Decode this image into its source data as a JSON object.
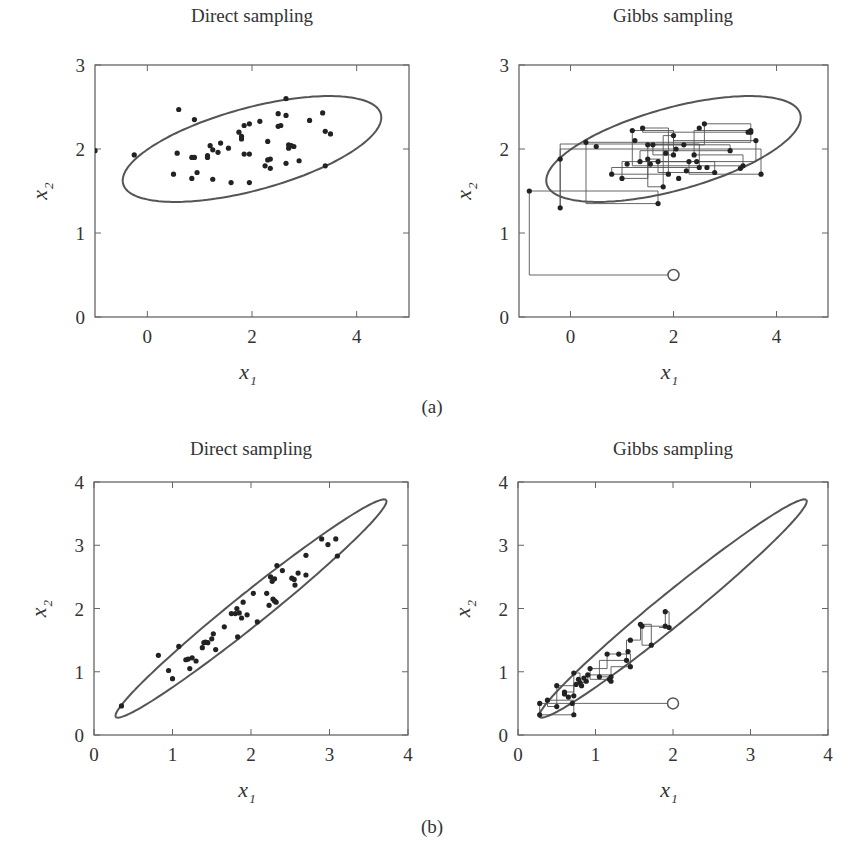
{
  "figure": {
    "caption_a": "(a)",
    "caption_b": "(b)",
    "colors": {
      "frame": "#666666",
      "ellipse": "#555555",
      "points": "#222222",
      "path": "#555555",
      "text": "#333333"
    }
  },
  "chart_data": [
    {
      "id": "a-direct",
      "type": "scatter",
      "title": "Direct sampling",
      "xlabel": "x1",
      "ylabel": "x2",
      "xlim": [
        -1,
        5
      ],
      "ylim": [
        0,
        3
      ],
      "xticks": [
        0,
        2,
        4
      ],
      "yticks": [
        0,
        1,
        2,
        3
      ],
      "grid": false,
      "ellipse": {
        "cx": 2.0,
        "cy": 2.0,
        "rx": 2.5,
        "ry": 0.5,
        "angle_deg": 9
      },
      "points": [
        [
          -1.0,
          1.98
        ],
        [
          -0.25,
          1.93
        ],
        [
          0.6,
          2.47
        ],
        [
          0.9,
          2.35
        ],
        [
          0.57,
          1.95
        ],
        [
          0.5,
          1.7
        ],
        [
          0.85,
          1.65
        ],
        [
          0.95,
          1.72
        ],
        [
          0.85,
          1.9
        ],
        [
          0.9,
          1.9
        ],
        [
          1.15,
          1.92
        ],
        [
          1.15,
          1.9
        ],
        [
          1.2,
          2.04
        ],
        [
          1.25,
          1.99
        ],
        [
          1.35,
          1.96
        ],
        [
          1.4,
          2.07
        ],
        [
          1.25,
          1.64
        ],
        [
          1.55,
          2.01
        ],
        [
          1.6,
          1.6
        ],
        [
          1.75,
          2.2
        ],
        [
          1.8,
          2.15
        ],
        [
          1.8,
          2.12
        ],
        [
          1.85,
          2.28
        ],
        [
          1.85,
          1.94
        ],
        [
          1.95,
          1.94
        ],
        [
          1.95,
          2.3
        ],
        [
          1.95,
          1.6
        ],
        [
          2.15,
          2.33
        ],
        [
          2.25,
          1.8
        ],
        [
          2.3,
          2.09
        ],
        [
          2.3,
          1.87
        ],
        [
          2.35,
          1.88
        ],
        [
          2.35,
          1.77
        ],
        [
          2.5,
          2.27
        ],
        [
          2.55,
          2.28
        ],
        [
          2.5,
          2.42
        ],
        [
          2.65,
          2.6
        ],
        [
          2.65,
          2.4
        ],
        [
          2.7,
          2.05
        ],
        [
          2.7,
          2.01
        ],
        [
          2.75,
          2.04
        ],
        [
          2.8,
          2.03
        ],
        [
          2.65,
          1.83
        ],
        [
          2.9,
          1.86
        ],
        [
          3.1,
          2.34
        ],
        [
          3.35,
          2.43
        ],
        [
          3.4,
          2.21
        ],
        [
          3.5,
          2.18
        ],
        [
          3.4,
          1.8
        ]
      ]
    },
    {
      "id": "a-gibbs",
      "type": "scatter",
      "title": "Gibbs sampling",
      "xlabel": "x1",
      "ylabel": "x2",
      "xlim": [
        -1,
        5
      ],
      "ylim": [
        0,
        3
      ],
      "xticks": [
        0,
        2,
        4
      ],
      "yticks": [
        0,
        1,
        2,
        3
      ],
      "grid": false,
      "ellipse": {
        "cx": 2.0,
        "cy": 2.0,
        "rx": 2.5,
        "ry": 0.5,
        "angle_deg": 9
      },
      "start": [
        2.0,
        0.5
      ],
      "path": [
        [
          2.0,
          0.5
        ],
        [
          -0.8,
          0.5
        ],
        [
          -0.8,
          1.5
        ],
        [
          1.7,
          1.5
        ],
        [
          1.7,
          1.35
        ],
        [
          0.3,
          1.35
        ],
        [
          0.3,
          2.08
        ],
        [
          3.5,
          2.08
        ],
        [
          3.5,
          2.2
        ],
        [
          1.4,
          2.2
        ],
        [
          1.4,
          2.25
        ],
        [
          1.9,
          2.25
        ],
        [
          1.9,
          1.7
        ],
        [
          0.8,
          1.7
        ],
        [
          0.8,
          1.78
        ],
        [
          2.5,
          1.78
        ],
        [
          2.5,
          2.06
        ],
        [
          -0.2,
          2.06
        ],
        [
          -0.2,
          1.88
        ],
        [
          -0.2,
          1.3
        ],
        [
          -0.2,
          2.0
        ],
        [
          3.7,
          2.0
        ],
        [
          3.7,
          1.7
        ],
        [
          2.3,
          1.7
        ],
        [
          2.3,
          1.85
        ],
        [
          1.0,
          1.85
        ],
        [
          1.0,
          1.65
        ],
        [
          1.5,
          1.65
        ],
        [
          1.5,
          2.05
        ],
        [
          2.6,
          2.05
        ],
        [
          2.6,
          2.3
        ],
        [
          3.5,
          2.3
        ],
        [
          3.5,
          2.22
        ],
        [
          2.4,
          2.22
        ],
        [
          2.4,
          1.93
        ],
        [
          3.35,
          1.93
        ],
        [
          3.35,
          1.8
        ],
        [
          1.2,
          1.8
        ],
        [
          1.2,
          2.22
        ],
        [
          2.0,
          2.22
        ],
        [
          2.0,
          1.93
        ],
        [
          1.6,
          1.93
        ],
        [
          1.6,
          2.05
        ],
        [
          3.1,
          2.05
        ],
        [
          3.1,
          1.98
        ],
        [
          1.35,
          1.98
        ],
        [
          1.35,
          1.85
        ],
        [
          2.8,
          1.85
        ],
        [
          2.8,
          1.72
        ],
        [
          1.7,
          1.72
        ],
        [
          1.7,
          1.85
        ],
        [
          3.6,
          1.85
        ],
        [
          3.6,
          2.1
        ],
        [
          2.0,
          2.1
        ],
        [
          2.0,
          2.16
        ],
        [
          1.8,
          2.16
        ],
        [
          1.8,
          1.55
        ],
        [
          1.5,
          1.55
        ],
        [
          1.5,
          1.88
        ],
        [
          1.75,
          1.88
        ]
      ],
      "points": [
        [
          -0.8,
          1.5
        ],
        [
          1.7,
          1.35
        ],
        [
          0.3,
          2.08
        ],
        [
          3.5,
          2.2
        ],
        [
          1.4,
          2.25
        ],
        [
          1.9,
          1.7
        ],
        [
          0.8,
          1.7
        ],
        [
          2.5,
          1.78
        ],
        [
          -0.2,
          1.88
        ],
        [
          -0.2,
          1.3
        ],
        [
          3.7,
          1.7
        ],
        [
          2.3,
          1.85
        ],
        [
          1.0,
          1.65
        ],
        [
          1.5,
          2.05
        ],
        [
          2.6,
          2.3
        ],
        [
          3.5,
          2.22
        ],
        [
          2.4,
          1.93
        ],
        [
          3.35,
          1.8
        ],
        [
          1.2,
          2.22
        ],
        [
          2.0,
          1.93
        ],
        [
          1.6,
          2.05
        ],
        [
          3.1,
          1.98
        ],
        [
          1.35,
          1.85
        ],
        [
          2.8,
          1.72
        ],
        [
          1.7,
          1.85
        ],
        [
          3.6,
          2.1
        ],
        [
          2.0,
          2.16
        ],
        [
          1.8,
          1.55
        ],
        [
          1.5,
          1.88
        ],
        [
          0.5,
          2.03
        ],
        [
          1.25,
          2.1
        ],
        [
          2.2,
          2.05
        ],
        [
          2.5,
          2.25
        ],
        [
          3.3,
          1.77
        ],
        [
          3.45,
          2.2
        ],
        [
          2.1,
          1.65
        ],
        [
          1.1,
          1.82
        ],
        [
          2.25,
          1.74
        ],
        [
          1.55,
          1.82
        ],
        [
          2.45,
          1.85
        ],
        [
          1.85,
          1.95
        ],
        [
          2.05,
          2.0
        ],
        [
          2.65,
          1.78
        ]
      ]
    },
    {
      "id": "b-direct",
      "type": "scatter",
      "title": "Direct sampling",
      "xlabel": "x1",
      "ylabel": "x2",
      "xlim": [
        0,
        4
      ],
      "ylim": [
        0,
        4
      ],
      "xticks": [
        0,
        1,
        2,
        3,
        4
      ],
      "yticks": [
        0,
        1,
        2,
        3,
        4
      ],
      "grid": false,
      "ellipse": {
        "cx": 2.0,
        "cy": 2.0,
        "rx": 2.43,
        "ry": 0.23,
        "angle_deg": 45
      },
      "points": [
        [
          0.35,
          0.46
        ],
        [
          0.82,
          1.26
        ],
        [
          0.95,
          1.02
        ],
        [
          1.0,
          0.89
        ],
        [
          1.08,
          1.4
        ],
        [
          1.17,
          1.19
        ],
        [
          1.2,
          1.2
        ],
        [
          1.22,
          1.05
        ],
        [
          1.25,
          1.22
        ],
        [
          1.3,
          1.17
        ],
        [
          1.38,
          1.38
        ],
        [
          1.4,
          1.46
        ],
        [
          1.42,
          1.47
        ],
        [
          1.45,
          1.46
        ],
        [
          1.5,
          1.52
        ],
        [
          1.52,
          1.6
        ],
        [
          1.55,
          1.35
        ],
        [
          1.66,
          1.71
        ],
        [
          1.75,
          1.92
        ],
        [
          1.8,
          1.92
        ],
        [
          1.82,
          2.0
        ],
        [
          1.83,
          1.55
        ],
        [
          1.85,
          1.93
        ],
        [
          1.88,
          1.85
        ],
        [
          1.9,
          2.1
        ],
        [
          1.95,
          1.9
        ],
        [
          2.03,
          2.24
        ],
        [
          2.08,
          1.79
        ],
        [
          2.2,
          2.24
        ],
        [
          2.23,
          2.05
        ],
        [
          2.25,
          2.5
        ],
        [
          2.27,
          2.43
        ],
        [
          2.28,
          2.15
        ],
        [
          2.3,
          2.12
        ],
        [
          2.3,
          2.47
        ],
        [
          2.32,
          2.1
        ],
        [
          2.33,
          2.68
        ],
        [
          2.4,
          2.6
        ],
        [
          2.52,
          2.48
        ],
        [
          2.55,
          2.46
        ],
        [
          2.56,
          2.37
        ],
        [
          2.6,
          2.56
        ],
        [
          2.7,
          2.84
        ],
        [
          2.7,
          2.53
        ],
        [
          2.9,
          3.1
        ],
        [
          2.98,
          3.01
        ],
        [
          3.08,
          3.1
        ],
        [
          3.1,
          2.83
        ]
      ]
    },
    {
      "id": "b-gibbs",
      "type": "scatter",
      "title": "Gibbs sampling",
      "xlabel": "x1",
      "ylabel": "x2",
      "xlim": [
        0,
        4
      ],
      "ylim": [
        0,
        4
      ],
      "xticks": [
        0,
        1,
        2,
        3,
        4
      ],
      "yticks": [
        0,
        1,
        2,
        3,
        4
      ],
      "grid": false,
      "ellipse": {
        "cx": 2.0,
        "cy": 2.0,
        "rx": 2.43,
        "ry": 0.23,
        "angle_deg": 45
      },
      "start": [
        2.0,
        0.5
      ],
      "path": [
        [
          2.0,
          0.5
        ],
        [
          0.28,
          0.5
        ],
        [
          0.28,
          0.32
        ],
        [
          0.72,
          0.32
        ],
        [
          0.72,
          0.55
        ],
        [
          0.38,
          0.55
        ],
        [
          0.38,
          0.45
        ],
        [
          0.5,
          0.45
        ],
        [
          0.5,
          0.78
        ],
        [
          0.72,
          0.78
        ],
        [
          0.72,
          0.62
        ],
        [
          0.6,
          0.62
        ],
        [
          0.6,
          0.68
        ],
        [
          0.72,
          0.68
        ],
        [
          0.72,
          0.98
        ],
        [
          0.8,
          0.98
        ],
        [
          0.8,
          0.83
        ],
        [
          0.9,
          0.83
        ],
        [
          0.9,
          0.95
        ],
        [
          1.18,
          0.95
        ],
        [
          1.18,
          0.88
        ],
        [
          0.93,
          0.88
        ],
        [
          0.93,
          1.05
        ],
        [
          1.15,
          1.05
        ],
        [
          1.15,
          1.28
        ],
        [
          1.45,
          1.28
        ],
        [
          1.45,
          1.08
        ],
        [
          1.2,
          1.08
        ],
        [
          1.2,
          0.92
        ],
        [
          1.05,
          0.92
        ],
        [
          1.05,
          1.18
        ],
        [
          1.4,
          1.18
        ],
        [
          1.4,
          1.5
        ],
        [
          1.58,
          1.5
        ],
        [
          1.58,
          1.75
        ],
        [
          1.72,
          1.75
        ],
        [
          1.72,
          1.42
        ],
        [
          1.6,
          1.42
        ],
        [
          1.6,
          1.72
        ],
        [
          1.9,
          1.72
        ],
        [
          1.9,
          1.95
        ],
        [
          1.95,
          1.95
        ],
        [
          1.95,
          1.7
        ],
        [
          1.82,
          1.7
        ]
      ],
      "points": [
        [
          0.28,
          0.5
        ],
        [
          0.28,
          0.32
        ],
        [
          0.72,
          0.32
        ],
        [
          0.38,
          0.55
        ],
        [
          0.5,
          0.45
        ],
        [
          0.5,
          0.78
        ],
        [
          0.72,
          0.62
        ],
        [
          0.6,
          0.68
        ],
        [
          0.72,
          0.98
        ],
        [
          0.8,
          0.83
        ],
        [
          0.9,
          0.95
        ],
        [
          1.18,
          0.88
        ],
        [
          0.93,
          1.05
        ],
        [
          1.15,
          1.28
        ],
        [
          1.45,
          1.08
        ],
        [
          1.2,
          0.92
        ],
        [
          1.05,
          0.92
        ],
        [
          1.4,
          1.18
        ],
        [
          1.45,
          1.5
        ],
        [
          1.58,
          1.75
        ],
        [
          1.72,
          1.42
        ],
        [
          1.6,
          1.72
        ],
        [
          1.9,
          1.72
        ],
        [
          1.9,
          1.95
        ],
        [
          1.95,
          1.7
        ],
        [
          0.75,
          0.8
        ],
        [
          0.82,
          0.78
        ],
        [
          0.85,
          0.9
        ],
        [
          0.78,
          0.88
        ],
        [
          0.88,
          0.85
        ],
        [
          0.65,
          0.6
        ],
        [
          1.2,
          0.85
        ],
        [
          1.3,
          1.28
        ],
        [
          1.42,
          1.32
        ],
        [
          0.6,
          0.65
        ],
        [
          0.7,
          0.5
        ]
      ]
    }
  ],
  "panels": [
    {
      "title": "Direct sampling",
      "xlabel": "x",
      "xsub": "1",
      "ylabel": "x",
      "ysub": "2",
      "xtick_labels": [
        "0",
        "2",
        "4"
      ],
      "ytick_labels": [
        "0",
        "1",
        "2",
        "3"
      ]
    },
    {
      "title": "Gibbs sampling",
      "xlabel": "x",
      "xsub": "1",
      "ylabel": "x",
      "ysub": "2",
      "xtick_labels": [
        "0",
        "2",
        "4"
      ],
      "ytick_labels": [
        "0",
        "1",
        "2",
        "3"
      ]
    },
    {
      "title": "Direct sampling",
      "xlabel": "x",
      "xsub": "1",
      "ylabel": "x",
      "ysub": "2",
      "xtick_labels": [
        "0",
        "1",
        "2",
        "3",
        "4"
      ],
      "ytick_labels": [
        "0",
        "1",
        "2",
        "3",
        "4"
      ]
    },
    {
      "title": "Gibbs sampling",
      "xlabel": "x",
      "xsub": "1",
      "ylabel": "x",
      "ysub": "2",
      "xtick_labels": [
        "0",
        "1",
        "2",
        "3",
        "4"
      ],
      "ytick_labels": [
        "0",
        "1",
        "2",
        "3",
        "4"
      ]
    }
  ]
}
